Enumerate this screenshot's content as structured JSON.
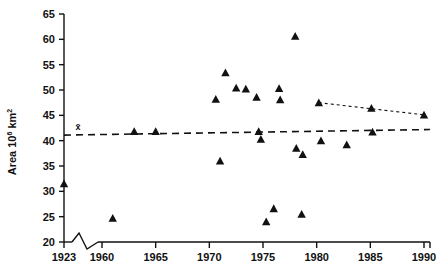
{
  "chart_data": {
    "type": "scatter",
    "title": "",
    "xlabel": "",
    "ylabel": "Area 10⁶ km²",
    "ylabel_base": "Area 10",
    "ylabel_exponent": "6",
    "ylabel_unit": "km",
    "ylabel_unit_exponent": "2",
    "xlim": [
      1923,
      1990
    ],
    "ylim": [
      20,
      65
    ],
    "grid": false,
    "legend": "none",
    "axis_break": {
      "present": true,
      "between": [
        1923,
        1960
      ],
      "style": "zigzag"
    },
    "x_ticks": [
      1923,
      1960,
      1965,
      1970,
      1975,
      1980,
      1985,
      1990
    ],
    "x_tick_labels": [
      "1923",
      "1960",
      "1965",
      "1970",
      "1975",
      "1980",
      "1985",
      "1990"
    ],
    "y_ticks": [
      20,
      25,
      30,
      35,
      40,
      45,
      50,
      55,
      60,
      65
    ],
    "y_tick_labels": [
      "20",
      "25",
      "30",
      "35",
      "40",
      "45",
      "50",
      "55",
      "60",
      "65"
    ],
    "marker": "triangle",
    "marker_color": "#111111",
    "points": [
      {
        "x": 1923,
        "y": 31.5
      },
      {
        "x": 1961,
        "y": 24.7
      },
      {
        "x": 1963,
        "y": 41.8
      },
      {
        "x": 1965,
        "y": 41.8
      },
      {
        "x": 1971,
        "y": 36.0
      },
      {
        "x": 1970.6,
        "y": 48.2
      },
      {
        "x": 1971.5,
        "y": 53.4
      },
      {
        "x": 1972.5,
        "y": 50.4
      },
      {
        "x": 1973.4,
        "y": 50.2
      },
      {
        "x": 1974.4,
        "y": 48.6
      },
      {
        "x": 1974.6,
        "y": 41.8
      },
      {
        "x": 1974.8,
        "y": 40.3
      },
      {
        "x": 1975.3,
        "y": 24.0
      },
      {
        "x": 1976.0,
        "y": 26.6
      },
      {
        "x": 1976.5,
        "y": 50.3
      },
      {
        "x": 1976.6,
        "y": 48.1
      },
      {
        "x": 1978.0,
        "y": 60.6
      },
      {
        "x": 1978.1,
        "y": 38.5
      },
      {
        "x": 1978.7,
        "y": 37.3
      },
      {
        "x": 1978.6,
        "y": 25.5
      },
      {
        "x": 1980.2,
        "y": 47.5
      },
      {
        "x": 1980.4,
        "y": 40.0
      },
      {
        "x": 1982.8,
        "y": 39.2
      },
      {
        "x": 1985.1,
        "y": 46.4
      },
      {
        "x": 1985.2,
        "y": 41.7
      },
      {
        "x": 1990.0,
        "y": 45.1
      }
    ],
    "mean_line": {
      "label": "x̄",
      "label_plain": "x-bar",
      "value_start": 41.1,
      "value_end": 42.2,
      "style": "dashed",
      "x_start": 1923,
      "x_end": 1990
    },
    "trend_line": {
      "style": "dotted",
      "x_start": 1980.2,
      "y_start": 47.5,
      "x_end": 1990.0,
      "y_end": 45.1
    }
  }
}
